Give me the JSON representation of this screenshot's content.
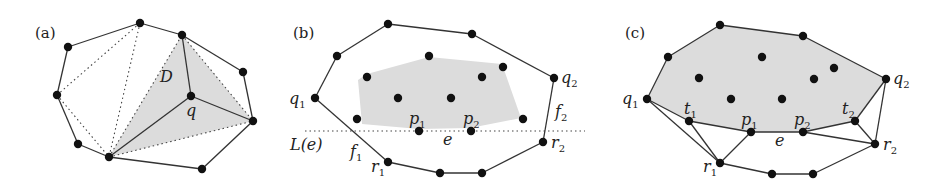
{
  "figure": {
    "colors": {
      "shade": "#dcdcdc",
      "edge": "#333333",
      "point": "#111111",
      "background": "#ffffff"
    },
    "panels": [
      {
        "id": "a",
        "label": "(a)",
        "label_pos": [
          35,
          38
        ],
        "region_label": "D",
        "region_label_pos": [
          160,
          82
        ],
        "point_label": "q",
        "point_label_pos": [
          186,
          116
        ],
        "points": [
          [
            140,
            23
          ],
          [
            68,
            47
          ],
          [
            182,
            35
          ],
          [
            243,
            72
          ],
          [
            57,
            95
          ],
          [
            191,
            96
          ],
          [
            253,
            121
          ],
          [
            78,
            144
          ],
          [
            109,
            157
          ],
          [
            202,
            169
          ]
        ],
        "shaded": [
          [
            182,
            35
          ],
          [
            253,
            121
          ],
          [
            109,
            157
          ]
        ],
        "solid_edges": [
          [
            [
              68,
              47
            ],
            [
              140,
              23
            ]
          ],
          [
            [
              140,
              23
            ],
            [
              182,
              35
            ]
          ],
          [
            [
              182,
              35
            ],
            [
              243,
              72
            ]
          ],
          [
            [
              243,
              72
            ],
            [
              253,
              121
            ]
          ],
          [
            [
              253,
              121
            ],
            [
              202,
              169
            ]
          ],
          [
            [
              202,
              169
            ],
            [
              109,
              157
            ]
          ],
          [
            [
              109,
              157
            ],
            [
              78,
              144
            ]
          ],
          [
            [
              78,
              144
            ],
            [
              57,
              95
            ]
          ],
          [
            [
              57,
              95
            ],
            [
              68,
              47
            ]
          ],
          [
            [
              182,
              35
            ],
            [
              191,
              96
            ]
          ],
          [
            [
              191,
              96
            ],
            [
              253,
              121
            ]
          ],
          [
            [
              191,
              96
            ],
            [
              109,
              157
            ]
          ]
        ],
        "dotted_edges": [
          [
            [
              57,
              95
            ],
            [
              140,
              23
            ]
          ],
          [
            [
              140,
              23
            ],
            [
              109,
              157
            ]
          ],
          [
            [
              57,
              95
            ],
            [
              109,
              157
            ]
          ],
          [
            [
              109,
              157
            ],
            [
              182,
              35
            ]
          ],
          [
            [
              182,
              35
            ],
            [
              253,
              121
            ]
          ],
          [
            [
              109,
              157
            ],
            [
              253,
              121
            ]
          ]
        ]
      },
      {
        "id": "b",
        "label": "(b)",
        "label_pos": [
          293,
          38
        ],
        "points": [
          [
            388,
            24
          ],
          [
            472,
            34
          ],
          [
            337,
            56
          ],
          [
            429,
            56
          ],
          [
            503,
            67
          ],
          [
            554,
            78
          ],
          [
            367,
            77
          ],
          [
            482,
            77
          ],
          [
            315,
            98
          ],
          [
            398,
            98
          ],
          [
            451,
            98
          ],
          [
            357,
            119
          ],
          [
            523,
            119
          ],
          [
            419,
            131
          ],
          [
            471,
            131
          ],
          [
            543,
            142
          ],
          [
            388,
            162
          ],
          [
            440,
            173
          ],
          [
            482,
            173
          ]
        ],
        "shaded": [
          [
            367,
            74
          ],
          [
            429,
            57
          ],
          [
            502,
            64
          ],
          [
            521,
            118
          ],
          [
            470,
            128
          ],
          [
            419,
            129
          ],
          [
            362,
            124
          ],
          [
            358,
            80
          ]
        ],
        "solid_edges": [
          [
            [
              315,
              98
            ],
            [
              337,
              56
            ]
          ],
          [
            [
              337,
              56
            ],
            [
              388,
              24
            ]
          ],
          [
            [
              388,
              24
            ],
            [
              472,
              34
            ]
          ],
          [
            [
              472,
              34
            ],
            [
              554,
              78
            ]
          ],
          [
            [
              554,
              78
            ],
            [
              543,
              142
            ]
          ],
          [
            [
              543,
              142
            ],
            [
              482,
              173
            ]
          ],
          [
            [
              482,
              173
            ],
            [
              440,
              173
            ]
          ],
          [
            [
              440,
              173
            ],
            [
              388,
              162
            ]
          ],
          [
            [
              388,
              162
            ],
            [
              315,
              98
            ]
          ]
        ],
        "dotted_edges": [
          [
            [
              305,
              131
            ],
            [
              585,
              131
            ]
          ]
        ],
        "labels": [
          {
            "text": "q",
            "sub": "1",
            "pos": [
              289,
              104
            ]
          },
          {
            "text": "q",
            "sub": "2",
            "pos": [
              561,
              83
            ]
          },
          {
            "text": "f",
            "sub": "2",
            "pos": [
              555,
              117
            ]
          },
          {
            "text": "p",
            "sub": "1",
            "pos": [
              409,
              124
            ]
          },
          {
            "text": "p",
            "sub": "2",
            "pos": [
              463,
              124
            ]
          },
          {
            "text": "e",
            "sub": "",
            "pos": [
              443,
              145
            ]
          },
          {
            "text": "L(e)",
            "sub": "",
            "pos": [
              290,
              150
            ]
          },
          {
            "text": "f",
            "sub": "1",
            "pos": [
              350,
              157
            ]
          },
          {
            "text": "r",
            "sub": "1",
            "pos": [
              371,
              172
            ]
          },
          {
            "text": "r",
            "sub": "2",
            "pos": [
              551,
              148
            ]
          }
        ]
      },
      {
        "id": "c",
        "label": "(c)",
        "label_pos": [
          625,
          38
        ],
        "points": [
          [
            720,
            25
          ],
          [
            803,
            36
          ],
          [
            668,
            57
          ],
          [
            762,
            57
          ],
          [
            834,
            68
          ],
          [
            886,
            79
          ],
          [
            699,
            78
          ],
          [
            814,
            79
          ],
          [
            647,
            99
          ],
          [
            731,
            99
          ],
          [
            782,
            99
          ],
          [
            689,
            121
          ],
          [
            855,
            121
          ],
          [
            751,
            132
          ],
          [
            803,
            132
          ],
          [
            875,
            144
          ],
          [
            720,
            163
          ],
          [
            772,
            174
          ],
          [
            813,
            174
          ]
        ],
        "shaded": [
          [
            647,
            99
          ],
          [
            668,
            57
          ],
          [
            720,
            25
          ],
          [
            803,
            36
          ],
          [
            886,
            79
          ],
          [
            855,
            121
          ],
          [
            803,
            132
          ],
          [
            751,
            132
          ],
          [
            689,
            121
          ]
        ],
        "solid_edges": [
          [
            [
              647,
              99
            ],
            [
              668,
              57
            ]
          ],
          [
            [
              668,
              57
            ],
            [
              720,
              25
            ]
          ],
          [
            [
              720,
              25
            ],
            [
              803,
              36
            ]
          ],
          [
            [
              803,
              36
            ],
            [
              886,
              79
            ]
          ],
          [
            [
              647,
              99
            ],
            [
              689,
              121
            ]
          ],
          [
            [
              689,
              121
            ],
            [
              751,
              132
            ]
          ],
          [
            [
              751,
              132
            ],
            [
              803,
              132
            ]
          ],
          [
            [
              803,
              132
            ],
            [
              855,
              121
            ]
          ],
          [
            [
              855,
              121
            ],
            [
              886,
              79
            ]
          ],
          [
            [
              647,
              99
            ],
            [
              720,
              163
            ]
          ],
          [
            [
              689,
              121
            ],
            [
              720,
              163
            ]
          ],
          [
            [
              720,
              163
            ],
            [
              751,
              132
            ]
          ],
          [
            [
              803,
              132
            ],
            [
              875,
              144
            ]
          ],
          [
            [
              855,
              121
            ],
            [
              875,
              144
            ]
          ],
          [
            [
              886,
              79
            ],
            [
              875,
              144
            ]
          ],
          [
            [
              720,
              163
            ],
            [
              772,
              174
            ]
          ],
          [
            [
              772,
              174
            ],
            [
              813,
              174
            ]
          ],
          [
            [
              813,
              174
            ],
            [
              875,
              144
            ]
          ]
        ],
        "dotted_edges": [],
        "labels": [
          {
            "text": "q",
            "sub": "1",
            "pos": [
              622,
              104
            ]
          },
          {
            "text": "q",
            "sub": "2",
            "pos": [
              893,
              84
            ]
          },
          {
            "text": "t",
            "sub": "1",
            "pos": [
              684,
              114
            ]
          },
          {
            "text": "t",
            "sub": "2",
            "pos": [
              842,
              114
            ]
          },
          {
            "text": "p",
            "sub": "1",
            "pos": [
              741,
              125
            ]
          },
          {
            "text": "p",
            "sub": "2",
            "pos": [
              794,
              125
            ]
          },
          {
            "text": "e",
            "sub": "",
            "pos": [
              775,
              146
            ]
          },
          {
            "text": "r",
            "sub": "1",
            "pos": [
              703,
              172
            ]
          },
          {
            "text": "r",
            "sub": "2",
            "pos": [
              883,
              150
            ]
          }
        ]
      }
    ]
  }
}
